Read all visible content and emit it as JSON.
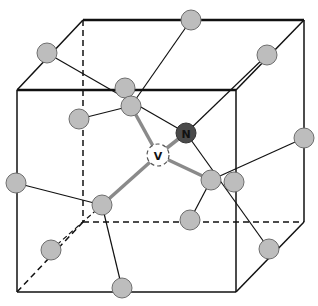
{
  "diagram": {
    "title": "",
    "colors": {
      "edge": "#111111",
      "atom_fill": "#bdbdbd",
      "atom_stroke": "#6e6e6e",
      "nitrogen_fill": "#4a4a4a",
      "vacancy_fill": "#ffffff",
      "strong_bond": "#8a8a8a"
    },
    "labels": {
      "nitrogen": "N",
      "vacancy": "V"
    },
    "cube": {
      "front": [
        [
          17,
          90
        ],
        [
          236,
          90
        ],
        [
          236,
          292
        ],
        [
          17,
          292
        ]
      ],
      "back": [
        [
          83,
          20
        ],
        [
          304,
          20
        ],
        [
          304,
          222
        ],
        [
          83,
          222
        ]
      ]
    },
    "atoms": [
      {
        "id": "a1",
        "x": 47,
        "y": 53
      },
      {
        "id": "a2",
        "x": 191,
        "y": 20
      },
      {
        "id": "a3",
        "x": 267,
        "y": 55
      },
      {
        "id": "a4",
        "x": 125,
        "y": 88
      },
      {
        "id": "a5",
        "x": 131,
        "y": 106
      },
      {
        "id": "a6",
        "x": 79,
        "y": 119
      },
      {
        "id": "a7",
        "x": 304,
        "y": 138
      },
      {
        "id": "a8",
        "x": 16,
        "y": 183
      },
      {
        "id": "a9",
        "x": 102,
        "y": 205
      },
      {
        "id": "a10",
        "x": 211,
        "y": 180
      },
      {
        "id": "a11",
        "x": 234,
        "y": 182
      },
      {
        "id": "a12",
        "x": 190,
        "y": 220
      },
      {
        "id": "a13",
        "x": 51,
        "y": 250
      },
      {
        "id": "a14",
        "x": 269,
        "y": 249
      },
      {
        "id": "a15",
        "x": 122,
        "y": 288
      }
    ],
    "nitrogen": {
      "x": 186,
      "y": 133
    },
    "vacancy": {
      "x": 158,
      "y": 155
    }
  }
}
